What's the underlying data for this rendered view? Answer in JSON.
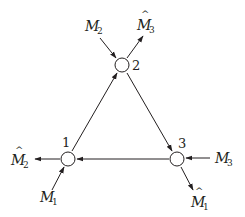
{
  "diagram": {
    "type": "cyclic-network",
    "colors": {
      "stroke": "#231f20",
      "node_fill": "#ffffff",
      "background": "#ffffff"
    },
    "nodes": [
      {
        "id": "1",
        "label": "1",
        "x": 68,
        "y": 159
      },
      {
        "id": "2",
        "label": "2",
        "x": 122,
        "y": 65
      },
      {
        "id": "3",
        "label": "3",
        "x": 177,
        "y": 159
      }
    ],
    "edges": [
      {
        "from": "1",
        "to": "2"
      },
      {
        "from": "2",
        "to": "3"
      },
      {
        "from": "3",
        "to": "1"
      }
    ],
    "external": {
      "node2_in": {
        "base": "M",
        "sub": "2",
        "hat": false
      },
      "node2_out": {
        "base": "M",
        "sub": "3",
        "hat": true
      },
      "node1_out": {
        "base": "M",
        "sub": "2",
        "hat": true
      },
      "node1_in": {
        "base": "M",
        "sub": "1",
        "hat": false
      },
      "node3_in": {
        "base": "M",
        "sub": "3",
        "hat": false
      },
      "node3_out": {
        "base": "M",
        "sub": "1",
        "hat": true
      }
    },
    "hat_glyph": "^"
  }
}
